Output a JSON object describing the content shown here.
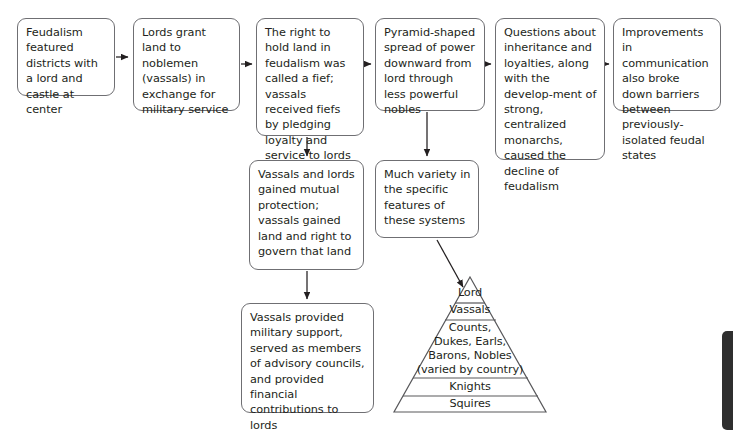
{
  "diagram": {
    "stroke_color": "#6f6f73",
    "text_color": "#231f20",
    "background_color": "#ffffff",
    "boxes": [
      {
        "id": "box1",
        "text": "Feudalism featured districts with a lord and castle at center"
      },
      {
        "id": "box2",
        "text": "Lords grant land to noblemen (vassals) in exchange for military service"
      },
      {
        "id": "box3",
        "text": "The right to hold land in feudalism was called a fief; vassals received fiefs by pledging loyalty and service to lords"
      },
      {
        "id": "box4",
        "text": "Pyramid-shaped spread of power downward from lord through less powerful nobles"
      },
      {
        "id": "box5",
        "text": "Questions about inheritance and loyalties, along with the develop-ment of strong, centralized monarchs, caused the decline of feudalism"
      },
      {
        "id": "box6",
        "text": "Improvements in communication also broke down barriers between previously-isolated feudal states"
      },
      {
        "id": "box7",
        "text": "Vassals and lords gained mutual protection; vassals gained land and right to govern that land"
      },
      {
        "id": "box8",
        "text": "Much variety in the specific features of these systems"
      },
      {
        "id": "box9",
        "text": "Vassals provided military support, served as members of advisory councils, and provided financial contributions to lords"
      }
    ],
    "pyramid": {
      "tiers": [
        {
          "label": "Lord"
        },
        {
          "label": "Vassals"
        },
        {
          "label": "Counts,"
        },
        {
          "label": "Dukes, Earls,"
        },
        {
          "label": "Barons, Nobles"
        },
        {
          "label": "(varied by country)"
        },
        {
          "label": "Knights"
        },
        {
          "label": "Squires"
        }
      ]
    }
  },
  "scrollbar": {
    "thumb_color": "#2f2f2f"
  }
}
